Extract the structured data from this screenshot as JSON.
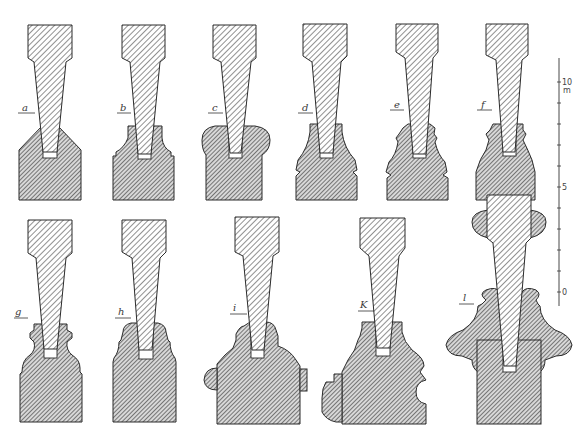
{
  "plate": {
    "description": "Technical section drawings of tapered tenons seated in moulded bases",
    "figures": [
      {
        "id": "a",
        "label": "a",
        "row": 1
      },
      {
        "id": "b",
        "label": "b",
        "row": 1
      },
      {
        "id": "c",
        "label": "c",
        "row": 1
      },
      {
        "id": "d",
        "label": "d",
        "row": 1
      },
      {
        "id": "e",
        "label": "e",
        "row": 1
      },
      {
        "id": "f",
        "label": "f",
        "row": 1
      },
      {
        "id": "g",
        "label": "g",
        "row": 2
      },
      {
        "id": "h",
        "label": "h",
        "row": 2
      },
      {
        "id": "i",
        "label": "i",
        "row": 2
      },
      {
        "id": "k",
        "label": "K",
        "row": 2
      },
      {
        "id": "l",
        "label": "l",
        "row": 2
      }
    ],
    "scale_bar": {
      "labels": [
        "10",
        "5",
        "0"
      ],
      "unit": "m",
      "ticks": 10
    },
    "colors": {
      "ink": "#2b2b2b",
      "post_hatch": "#555555",
      "base_hatch": "#4a4a4a",
      "paper": "#ffffff"
    }
  }
}
